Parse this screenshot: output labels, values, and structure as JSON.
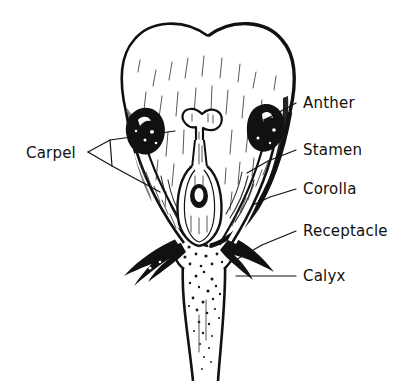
{
  "figure": {
    "background_color": "#ffffff",
    "ink_color": "#111111"
  },
  "labels": [
    {
      "id": "anther",
      "text": "Anther",
      "x": 303,
      "y": 108,
      "anchor": "start"
    },
    {
      "id": "stamen",
      "text": "Stamen",
      "x": 303,
      "y": 155,
      "anchor": "start"
    },
    {
      "id": "corolla",
      "text": "Corolla",
      "x": 303,
      "y": 194,
      "anchor": "start"
    },
    {
      "id": "receptacle",
      "text": "Receptacle",
      "x": 303,
      "y": 236,
      "anchor": "start"
    },
    {
      "id": "calyx",
      "text": "Calyx",
      "x": 303,
      "y": 281,
      "anchor": "start"
    },
    {
      "id": "carpel",
      "text": "Carpel",
      "x": 26,
      "y": 158,
      "anchor": "start"
    }
  ],
  "leaders": [
    {
      "id": "anther-leader",
      "points": "296,103 272,116 255,124"
    },
    {
      "id": "stamen-leader",
      "points": "296,150 268,161 247,173"
    },
    {
      "id": "corolla-leader",
      "points": "296,189 270,197 253,205"
    },
    {
      "id": "receptacle-leader",
      "points": "296,231 262,245 232,262"
    },
    {
      "id": "calyx-leader",
      "points": "296,276 236,276"
    },
    {
      "id": "carpel-leader-upper",
      "points": "88,152 110,140 175,131"
    },
    {
      "id": "carpel-leader-lower",
      "points": "88,152 112,166 160,192"
    },
    {
      "id": "carpel-fork",
      "points": "110,140 112,166"
    }
  ],
  "anatomy": [
    {
      "id": "corolla-body",
      "name": "corolla",
      "description": "heart-shaped petal mass with notched apex"
    },
    {
      "id": "anther-left",
      "name": "anther",
      "description": "solid black oval with white highlight"
    },
    {
      "id": "anther-right",
      "name": "anther",
      "description": "solid black oval with white highlight"
    },
    {
      "id": "filament-left",
      "name": "filament",
      "description": "tapered stalk to receptacle"
    },
    {
      "id": "filament-right",
      "name": "filament",
      "description": "tapered stalk to receptacle"
    },
    {
      "id": "stigma",
      "name": "stigma",
      "description": "lobed head atop style"
    },
    {
      "id": "style",
      "name": "style",
      "description": "narrow column"
    },
    {
      "id": "ovary",
      "name": "ovary",
      "description": "swollen base containing ovule"
    },
    {
      "id": "ovule",
      "name": "ovule",
      "description": "small ring inside ovary"
    },
    {
      "id": "receptacle",
      "name": "receptacle",
      "description": "stippled swollen stem top"
    },
    {
      "id": "sepal-left",
      "name": "sepal",
      "description": "curved black sepal"
    },
    {
      "id": "sepal-right",
      "name": "sepal",
      "description": "curved black sepal"
    },
    {
      "id": "stem",
      "name": "stem",
      "description": "stippled pedicel running to lower edge"
    }
  ]
}
